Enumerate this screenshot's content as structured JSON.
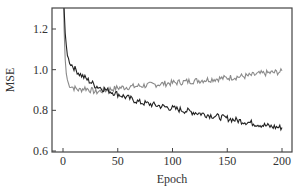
{
  "chart_data": {
    "type": "line",
    "title": "",
    "xlabel": "Epoch",
    "ylabel": "MSE",
    "xlim": [
      -10,
      209
    ],
    "ylim": [
      0.6,
      1.3
    ],
    "xticks": [
      0,
      50,
      100,
      150,
      200
    ],
    "yticks": [
      0.6,
      0.8,
      1.0,
      1.2
    ],
    "xtick_labels": [
      "0",
      "50",
      "100",
      "150",
      "200"
    ],
    "ytick_labels": [
      "0.6",
      "0.8",
      "1.0",
      "1.2"
    ],
    "grid": false,
    "legend": null,
    "series": [
      {
        "name": "black",
        "color": "#222222",
        "x": [
          0,
          1,
          2,
          3,
          4,
          5,
          7,
          10,
          15,
          20,
          25,
          30,
          35,
          40,
          45,
          50,
          60,
          70,
          80,
          90,
          100,
          110,
          120,
          130,
          140,
          150,
          160,
          170,
          180,
          190,
          200
        ],
        "y": [
          1.5,
          1.3,
          1.18,
          1.12,
          1.08,
          1.05,
          1.03,
          1.01,
          0.98,
          0.96,
          0.94,
          0.92,
          0.91,
          0.9,
          0.89,
          0.88,
          0.86,
          0.84,
          0.83,
          0.82,
          0.81,
          0.8,
          0.79,
          0.78,
          0.77,
          0.76,
          0.75,
          0.74,
          0.73,
          0.72,
          0.715
        ]
      },
      {
        "name": "gray",
        "color": "#8a8a8a",
        "x": [
          0,
          1,
          2,
          3,
          4,
          5,
          7,
          10,
          15,
          20,
          25,
          30,
          35,
          40,
          45,
          50,
          60,
          70,
          80,
          90,
          100,
          110,
          120,
          130,
          140,
          150,
          160,
          170,
          180,
          190,
          200
        ],
        "y": [
          1.5,
          1.2,
          1.05,
          0.98,
          0.95,
          0.93,
          0.92,
          0.91,
          0.9,
          0.91,
          0.9,
          0.89,
          0.895,
          0.9,
          0.905,
          0.91,
          0.915,
          0.92,
          0.925,
          0.93,
          0.935,
          0.94,
          0.945,
          0.95,
          0.955,
          0.96,
          0.965,
          0.97,
          0.98,
          0.985,
          0.99
        ]
      }
    ]
  }
}
